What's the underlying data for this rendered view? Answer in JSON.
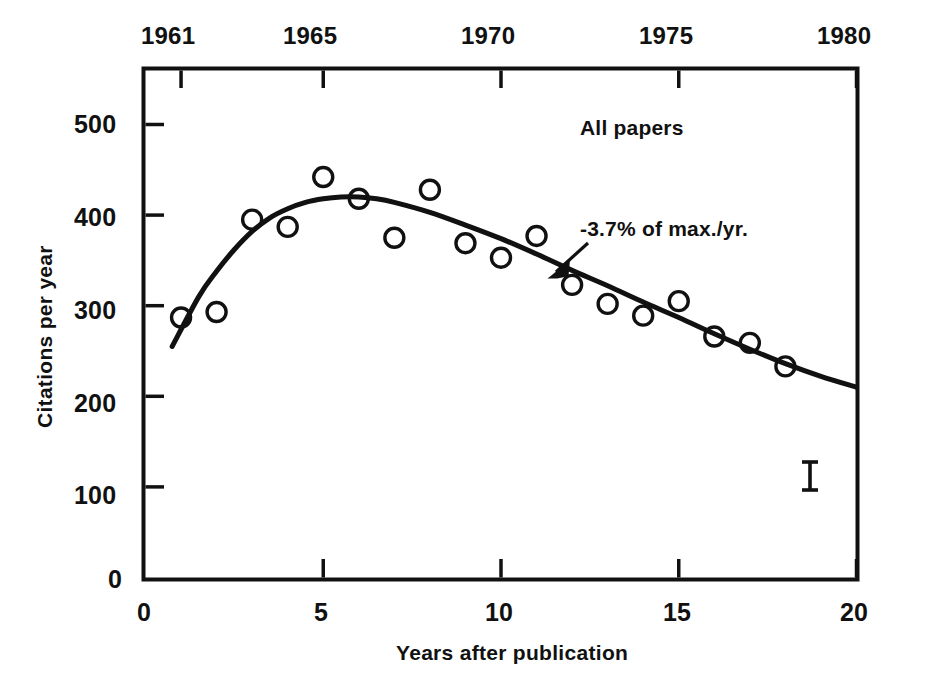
{
  "chart_data": {
    "type": "scatter",
    "title": "",
    "series_label": "All papers",
    "xlabel": "Years after publication",
    "ylabel": "Citations per year",
    "xlim": [
      0,
      20
    ],
    "ylim": [
      0,
      550
    ],
    "grid": false,
    "legend": "none",
    "x_ticks": [
      "0",
      "5",
      "10",
      "15",
      "20"
    ],
    "x_tick_values": [
      0,
      5,
      10,
      15,
      20
    ],
    "y_ticks": [
      "0",
      "100",
      "200",
      "300",
      "400",
      "500"
    ],
    "y_tick_values": [
      0,
      100,
      200,
      300,
      400,
      500
    ],
    "secondary_axis": {
      "position": "top",
      "label": "",
      "ticks": [
        "1961",
        "1965",
        "1970",
        "1975",
        "1980"
      ],
      "tick_x_values": [
        1,
        5,
        10,
        15,
        20
      ]
    },
    "x": [
      1,
      2,
      3,
      4,
      5,
      6,
      7,
      8,
      9,
      10,
      11,
      12,
      13,
      14,
      15,
      16,
      17,
      18
    ],
    "values": [
      287,
      293,
      395,
      387,
      442,
      418,
      375,
      428,
      369,
      353,
      377,
      323,
      302,
      289,
      305,
      266,
      259,
      233
    ],
    "marker": "open-circle",
    "fit_curve": {
      "label": "-3.7% of max./yr.",
      "description": "smooth fitted trend curve peaking near year 6 at about 420 and decaying thereafter",
      "points": [
        [
          0.75,
          255
        ],
        [
          1.5,
          310
        ],
        [
          2.0,
          338
        ],
        [
          2.5,
          362
        ],
        [
          3.0,
          382
        ],
        [
          3.5,
          397
        ],
        [
          4.0,
          407
        ],
        [
          4.5,
          414
        ],
        [
          5.0,
          418
        ],
        [
          5.5,
          420
        ],
        [
          6.0,
          420
        ],
        [
          6.5,
          418
        ],
        [
          7.0,
          414
        ],
        [
          8.0,
          403
        ],
        [
          9.0,
          389
        ],
        [
          10.0,
          374
        ],
        [
          11.0,
          357
        ],
        [
          12.0,
          339
        ],
        [
          13.0,
          322
        ],
        [
          14.0,
          304
        ],
        [
          15.0,
          287
        ],
        [
          16.0,
          269
        ],
        [
          17.0,
          252
        ],
        [
          18.0,
          236
        ],
        [
          19.0,
          222
        ],
        [
          20.0,
          210
        ]
      ]
    },
    "error_bar": {
      "x": 18.7,
      "center": 117,
      "half_height": 16
    },
    "annotations": [
      {
        "text": "All papers",
        "x": 13.7,
        "y": 505
      },
      {
        "text": "-3.7% of max./yr.",
        "x": 12.3,
        "y": 383
      }
    ]
  },
  "axes": {
    "top_ticks": [
      {
        "label": "1961"
      },
      {
        "label": "1965"
      },
      {
        "label": "1970"
      },
      {
        "label": "1975"
      },
      {
        "label": "1980"
      }
    ],
    "y_ticks": [
      {
        "label": "500"
      },
      {
        "label": "400"
      },
      {
        "label": "300"
      },
      {
        "label": "200"
      },
      {
        "label": "100"
      },
      {
        "label": "0"
      }
    ],
    "x_ticks": [
      {
        "label": "0"
      },
      {
        "label": "5"
      },
      {
        "label": "10"
      },
      {
        "label": "15"
      },
      {
        "label": "20"
      }
    ],
    "x_title": "Years after publication",
    "y_title": "Citations per year"
  },
  "labels": {
    "series": "All papers",
    "decay": "-3.7% of max./yr."
  },
  "colors": {
    "ink": "#111111",
    "background": "#ffffff"
  }
}
